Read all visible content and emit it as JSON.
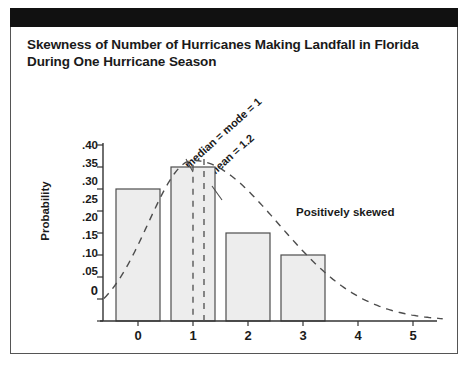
{
  "figure": {
    "title": "Skewness of Number of Hurricanes Making Landfall in Florida During One Hurricane Season",
    "title_line1": "Skewness of Number of Hurricanes Making Landfall in Florida",
    "title_line2": "During One Hurricane Season",
    "header_bar_color": "#111111",
    "border_color": "#555555",
    "background_color": "#ffffff"
  },
  "chart_data": {
    "type": "bar",
    "title": "Skewness of Number of Hurricanes Making Landfall in Florida During One Hurricane Season",
    "xlabel": "",
    "ylabel": "Probability",
    "categories": [
      "0",
      "1",
      "2",
      "3",
      "4",
      "5"
    ],
    "values": [
      0.3,
      0.35,
      0.2,
      0.15,
      0.0,
      0.0
    ],
    "ylim": [
      0,
      0.4
    ],
    "xlim": [
      -0.5,
      5.5
    ],
    "ytick_labels": [
      ".40",
      ".35",
      ".30",
      ".25",
      ".20",
      ".15",
      ".10",
      ".05",
      "0"
    ],
    "ytick_values": [
      0.4,
      0.35,
      0.3,
      0.25,
      0.2,
      0.15,
      0.1,
      0.05,
      0.0
    ],
    "xtick_labels": [
      "0",
      "1",
      "2",
      "3",
      "4",
      "5"
    ],
    "grid": false,
    "legend": "none",
    "bar_fill_color": "#ededed",
    "bar_edge_color": "#4d4d4d",
    "overlay_curve": {
      "name": "smoothed distribution curve",
      "style": "dashed",
      "color": "#4d4d4d"
    },
    "annotations": [
      {
        "name": "median-mode-marker",
        "text": "median = mode = 1",
        "value": 1,
        "style": "dashed vertical line",
        "rotation_deg": -42
      },
      {
        "name": "mean-marker",
        "text": "mean = 1.2",
        "value": 1.2,
        "style": "dashed vertical line",
        "rotation_deg": -42
      },
      {
        "name": "skew-note",
        "text": "Positively skewed",
        "rotation_deg": 0
      }
    ]
  }
}
